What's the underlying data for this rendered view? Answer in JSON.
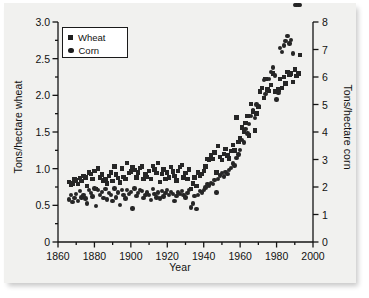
{
  "chart_data": {
    "type": "scatter",
    "title": "",
    "xlabel": "Year",
    "ylabel": "Tons/hectare wheat",
    "ylabel_right": "Tons/hectare corn",
    "xlim": [
      1860,
      2000
    ],
    "ylim": [
      0,
      3.0
    ],
    "ylim_right": [
      0,
      8
    ],
    "xticks": [
      "1860",
      "1880",
      "1900",
      "1920",
      "1940",
      "1960",
      "1980",
      "2000"
    ],
    "xtick_values": [
      1860,
      1880,
      1900,
      1920,
      1940,
      1960,
      1980,
      2000
    ],
    "yticks_left": [
      "0",
      "0.5",
      "1.0",
      "1.5",
      "2.0",
      "2.5",
      "3.0"
    ],
    "ytick_values_left": [
      0,
      0.5,
      1.0,
      1.5,
      2.0,
      2.5,
      3.0
    ],
    "yticks_right": [
      "0",
      "1",
      "2",
      "3",
      "4",
      "5",
      "6",
      "7",
      "8"
    ],
    "ytick_values_right": [
      0,
      1,
      2,
      3,
      4,
      5,
      6,
      7,
      8
    ],
    "grid": false,
    "legend_position": "top-left",
    "marker_color": "#262626",
    "series": [
      {
        "name": "Wheat",
        "marker": "square",
        "axis": "left",
        "unit": "tons/hectare",
        "x": [
          1866,
          1867,
          1868,
          1869,
          1870,
          1871,
          1872,
          1873,
          1874,
          1875,
          1876,
          1877,
          1878,
          1879,
          1880,
          1881,
          1882,
          1883,
          1884,
          1885,
          1886,
          1887,
          1888,
          1889,
          1890,
          1891,
          1892,
          1893,
          1894,
          1895,
          1896,
          1897,
          1898,
          1899,
          1900,
          1901,
          1902,
          1903,
          1904,
          1905,
          1906,
          1907,
          1908,
          1909,
          1910,
          1911,
          1912,
          1913,
          1914,
          1915,
          1916,
          1917,
          1918,
          1919,
          1920,
          1921,
          1922,
          1923,
          1924,
          1925,
          1926,
          1927,
          1928,
          1929,
          1930,
          1931,
          1932,
          1933,
          1934,
          1935,
          1936,
          1937,
          1938,
          1939,
          1940,
          1941,
          1942,
          1943,
          1944,
          1945,
          1946,
          1947,
          1948,
          1949,
          1950,
          1951,
          1952,
          1953,
          1954,
          1955,
          1956,
          1957,
          1958,
          1959,
          1960,
          1961,
          1962,
          1963,
          1964,
          1965,
          1966,
          1967,
          1968,
          1969,
          1970,
          1971,
          1972,
          1973,
          1974,
          1975,
          1976,
          1977,
          1978,
          1979,
          1980,
          1981,
          1982,
          1983,
          1984,
          1985,
          1986,
          1987,
          1988,
          1989,
          1990,
          1991,
          1992,
          1993
        ],
        "y": [
          0.82,
          0.78,
          0.8,
          0.86,
          0.84,
          0.79,
          0.87,
          0.83,
          0.9,
          0.88,
          0.76,
          0.95,
          0.93,
          0.86,
          0.97,
          0.72,
          1.0,
          0.88,
          0.92,
          0.84,
          0.86,
          0.8,
          0.9,
          0.95,
          0.83,
          1.03,
          0.92,
          0.87,
          0.81,
          1.0,
          0.89,
          0.86,
          1.08,
          0.94,
          0.96,
          1.02,
          0.98,
          0.88,
          0.95,
          1.01,
          1.03,
          0.86,
          0.92,
          0.89,
          0.97,
          0.86,
          1.04,
          0.99,
          0.94,
          1.08,
          0.82,
          0.93,
          0.99,
          0.86,
          0.95,
          0.88,
          1.02,
          0.96,
          0.9,
          0.84,
          0.97,
          1.02,
          1.05,
          0.88,
          0.94,
          0.86,
          0.99,
          0.72,
          0.8,
          0.88,
          0.76,
          0.95,
          0.9,
          0.93,
          0.97,
          1.03,
          1.13,
          1.12,
          1.18,
          1.13,
          1.22,
          0.95,
          1.31,
          1.16,
          1.12,
          1.2,
          1.27,
          1.18,
          1.14,
          1.24,
          1.32,
          1.25,
          1.7,
          1.36,
          1.42,
          1.56,
          1.5,
          1.62,
          1.72,
          1.45,
          1.88,
          1.78,
          1.52,
          1.75,
          1.84,
          2.05,
          2.1,
          1.96,
          2.22,
          2.08,
          2.06,
          2.14,
          2.3,
          2.05,
          2.06,
          2.08,
          2.22,
          2.1,
          2.25,
          2.16,
          2.32,
          2.28,
          2.3,
          2.18,
          2.35,
          2.26,
          2.3,
          2.55
        ],
        "y_right_equivalent_note": "left axis only"
      },
      {
        "name": "Corn",
        "marker": "circle",
        "axis": "right",
        "unit": "tons/hectare",
        "x": [
          1866,
          1867,
          1868,
          1869,
          1870,
          1871,
          1872,
          1873,
          1874,
          1875,
          1876,
          1877,
          1878,
          1879,
          1880,
          1881,
          1882,
          1883,
          1884,
          1885,
          1886,
          1887,
          1888,
          1889,
          1890,
          1891,
          1892,
          1893,
          1894,
          1895,
          1896,
          1897,
          1898,
          1899,
          1900,
          1901,
          1902,
          1903,
          1904,
          1905,
          1906,
          1907,
          1908,
          1909,
          1910,
          1911,
          1912,
          1913,
          1914,
          1915,
          1916,
          1917,
          1918,
          1919,
          1920,
          1921,
          1922,
          1923,
          1924,
          1925,
          1926,
          1927,
          1928,
          1929,
          1930,
          1931,
          1932,
          1933,
          1934,
          1935,
          1936,
          1937,
          1938,
          1939,
          1940,
          1941,
          1942,
          1943,
          1944,
          1945,
          1946,
          1947,
          1948,
          1949,
          1950,
          1951,
          1952,
          1953,
          1954,
          1955,
          1956,
          1957,
          1958,
          1959,
          1960,
          1961,
          1962,
          1963,
          1964,
          1965,
          1966,
          1967,
          1968,
          1969,
          1970,
          1971,
          1972,
          1973,
          1974,
          1975,
          1976,
          1977,
          1978,
          1979,
          1980,
          1981,
          1982,
          1983,
          1984,
          1985,
          1986,
          1987,
          1988,
          1989,
          1990,
          1991,
          1992,
          1993
        ],
        "y_right": [
          1.55,
          1.7,
          1.45,
          1.6,
          1.75,
          1.5,
          1.85,
          1.62,
          1.72,
          1.58,
          1.4,
          1.9,
          1.78,
          1.66,
          1.95,
          1.3,
          1.88,
          1.7,
          1.82,
          1.6,
          1.92,
          1.55,
          1.78,
          1.7,
          1.48,
          1.95,
          1.62,
          1.8,
          1.35,
          1.88,
          1.72,
          1.58,
          1.9,
          1.75,
          1.82,
          1.22,
          1.95,
          1.68,
          1.78,
          1.88,
          1.85,
          1.6,
          1.72,
          1.8,
          1.7,
          1.52,
          1.92,
          1.75,
          1.62,
          1.8,
          1.58,
          1.86,
          1.66,
          1.78,
          1.88,
          1.7,
          1.82,
          1.75,
          1.5,
          1.68,
          1.8,
          1.74,
          1.86,
          1.7,
          1.62,
          1.78,
          1.88,
          1.25,
          1.4,
          1.68,
          1.2,
          1.72,
          1.85,
          1.8,
          1.9,
          1.98,
          2.1,
          2.05,
          2.15,
          2.12,
          2.25,
          1.8,
          2.3,
          2.42,
          2.5,
          2.38,
          2.55,
          2.48,
          2.62,
          2.7,
          2.85,
          2.78,
          3.05,
          3.18,
          3.35,
          3.72,
          3.62,
          4.1,
          3.95,
          4.3,
          4.58,
          4.8,
          4.52,
          5.0,
          4.95,
          5.48,
          5.6,
          5.9,
          5.38,
          5.55,
          5.92,
          6.18,
          6.35,
          6.05,
          5.18,
          5.42,
          7.05,
          6.9,
          7.15,
          7.3,
          7.48,
          7.22,
          7.35,
          6.85
        ],
        "low_note": "mid-1930s drought lows near 1.2"
      }
    ],
    "annotations": []
  },
  "legend": {
    "items": [
      {
        "label": "Wheat",
        "marker": "square"
      },
      {
        "label": "Corn",
        "marker": "circle"
      }
    ]
  }
}
